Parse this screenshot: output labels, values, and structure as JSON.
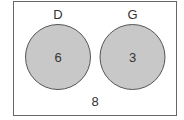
{
  "diagram": {
    "type": "venn",
    "sets": [
      {
        "label": "D",
        "value": "6"
      },
      {
        "label": "G",
        "value": "3"
      }
    ],
    "outside_value": "8",
    "colors": {
      "circle_fill": "#c8c8c8",
      "circle_stroke": "#555555",
      "border": "#666666"
    }
  }
}
